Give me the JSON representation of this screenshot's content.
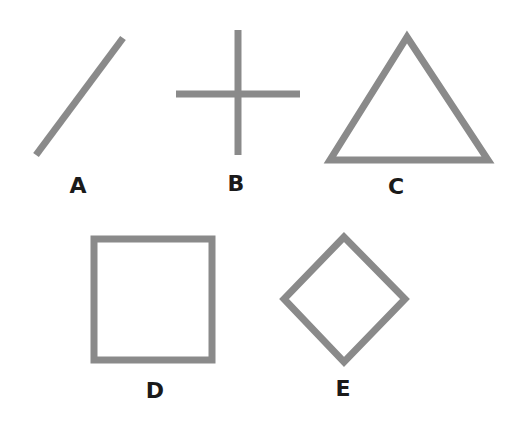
{
  "stroke_color": "#8a8a8a",
  "label_color": "#1a1a1a",
  "shapes": [
    {
      "id": "A",
      "label": "A",
      "kind": "diagonal line"
    },
    {
      "id": "B",
      "label": "B",
      "kind": "cross"
    },
    {
      "id": "C",
      "label": "C",
      "kind": "triangle"
    },
    {
      "id": "D",
      "label": "D",
      "kind": "square"
    },
    {
      "id": "E",
      "label": "E",
      "kind": "diamond"
    }
  ]
}
